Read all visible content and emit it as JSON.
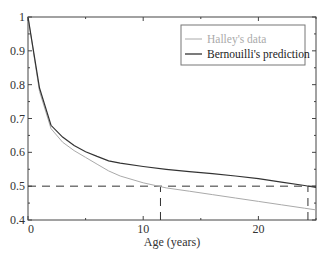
{
  "chart_data": {
    "type": "line",
    "title": "",
    "xlabel": "Age (years)",
    "ylabel": "",
    "xlim": [
      0,
      25
    ],
    "ylim": [
      0.4,
      1.0
    ],
    "x_ticks": [
      0,
      10,
      20
    ],
    "x_tick_labels": [
      "0",
      "10",
      "20"
    ],
    "y_ticks": [
      0.4,
      0.5,
      0.6,
      0.7,
      0.8,
      0.9,
      1.0
    ],
    "y_tick_labels": [
      "0.4",
      "0.5",
      "0.6",
      "0.7",
      "0.8",
      "0.9",
      "1"
    ],
    "grid": false,
    "legend_position": "upper right",
    "series": [
      {
        "name": "Halley's data",
        "color": "#aaaaaa",
        "x": [
          0,
          1,
          2,
          3,
          4,
          5,
          6,
          7,
          8,
          10,
          12,
          14,
          16,
          18,
          20,
          22,
          24,
          25
        ],
        "y": [
          1.0,
          0.78,
          0.67,
          0.63,
          0.605,
          0.585,
          0.565,
          0.545,
          0.53,
          0.51,
          0.495,
          0.485,
          0.475,
          0.465,
          0.455,
          0.445,
          0.435,
          0.43
        ]
      },
      {
        "name": "Bernouilli's prediction",
        "color": "#333333",
        "x": [
          0,
          1,
          2,
          3,
          4,
          5,
          6,
          7,
          8,
          10,
          12,
          14,
          16,
          18,
          20,
          22,
          24,
          25
        ],
        "y": [
          1.0,
          0.79,
          0.68,
          0.645,
          0.62,
          0.602,
          0.588,
          0.575,
          0.568,
          0.558,
          0.55,
          0.543,
          0.537,
          0.53,
          0.522,
          0.512,
          0.502,
          0.496
        ]
      }
    ],
    "annotations": [
      {
        "type": "hline",
        "y": 0.5,
        "style": "dashed",
        "x_from": 0,
        "x_to": 25
      },
      {
        "type": "vline",
        "x": 11.5,
        "style": "dashed",
        "y_from": 0.4,
        "y_to": 0.5,
        "label": "Halley's data crosses 0.5"
      },
      {
        "type": "vline",
        "x": 24.3,
        "style": "dashed",
        "y_from": 0.4,
        "y_to": 0.5,
        "label": "Bernouilli's prediction crosses 0.5"
      }
    ]
  },
  "legend": {
    "items": [
      "Halley's data",
      "Bernouilli's prediction"
    ]
  }
}
